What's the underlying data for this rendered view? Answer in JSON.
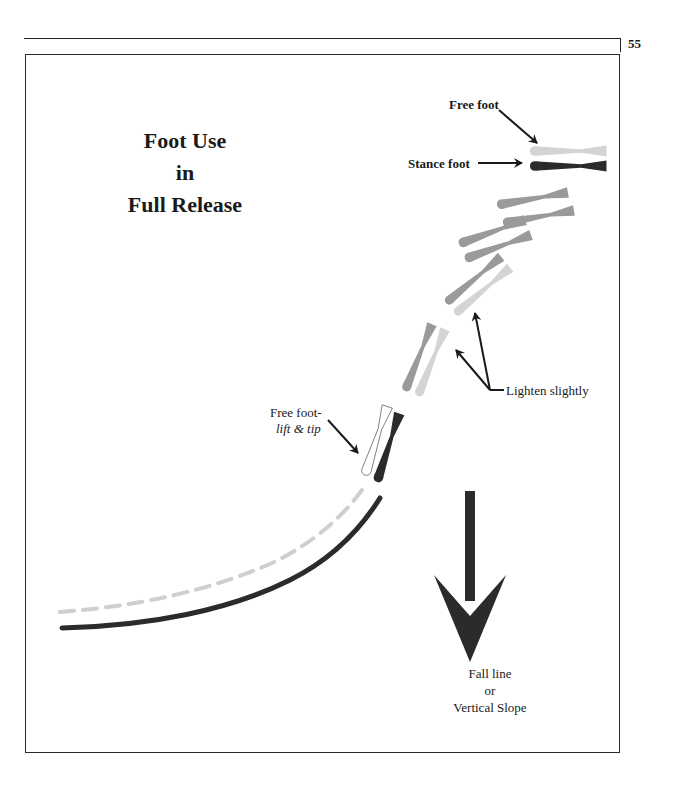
{
  "page": {
    "page_number": "55"
  },
  "diagram": {
    "title_lines": [
      "Foot Use",
      "in",
      "Full Release"
    ],
    "labels": {
      "free_foot": "Free foot",
      "stance_foot": "Stance foot",
      "lighten": "Lighten slightly",
      "free_foot_lift": "Free foot-",
      "lift_tip": "lift & tip",
      "fall_line": [
        "Fall line",
        "or",
        "Vertical Slope"
      ]
    },
    "colors": {
      "stance_dark": "#2b2b2b",
      "mid_gray": "#9a9a9a",
      "light_gray": "#d0d0d0",
      "arrow": "#1a1a1a"
    }
  }
}
